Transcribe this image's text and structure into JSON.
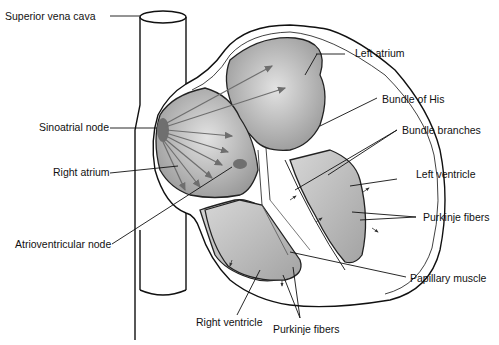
{
  "diagram": {
    "type": "anatomical-illustration",
    "labels": {
      "superior_vena_cava": "Superior vena cava",
      "sinoatrial_node": "Sinoatrial node",
      "right_atrium": "Right atrium",
      "atrioventricular_node": "Atrioventricular node",
      "right_ventricle": "Right ventricle",
      "purkinje_fibers_bottom": "Purkinje fibers",
      "papillary_muscle": "Papillary muscle",
      "purkinje_fibers_right": "Purkinje fibers",
      "left_ventricle": "Left ventricle",
      "bundle_branches": "Bundle branches",
      "bundle_of_his": "Bundle of His",
      "left_atrium": "Left atrium"
    },
    "colors": {
      "chamber_fill": "#b9b9b9",
      "node_fill": "#6f6f6f",
      "outline": "#111111",
      "arrow": "#6e6e6e"
    }
  }
}
